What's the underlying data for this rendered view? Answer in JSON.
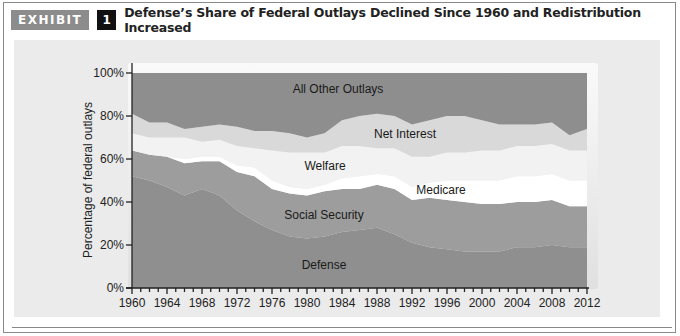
{
  "header": {
    "exhibit_label": "EXHIBIT",
    "exhibit_number": "1",
    "title": "Defense’s Share of Federal Outlays Declined Since 1960 and Redistribution Increased"
  },
  "colors": {
    "exhibit_badge": "#8c8c8c",
    "number_badge": "#111111",
    "panel_bg": "#ebebeb",
    "defense": "#8f8f8f",
    "social_security": "#9d9d9d",
    "medicare": "#ffffff",
    "welfare": "#f2f2f2",
    "net_interest": "#d9d9d9",
    "all_other": "#8e8e8e"
  },
  "chart_data": {
    "type": "area",
    "stacked": true,
    "title": "Defense’s Share of Federal Outlays Declined Since 1960 and Redistribution Increased",
    "xlabel": "",
    "ylabel": "Percentage of federal outlays",
    "ylim": [
      0,
      100
    ],
    "xlim": [
      1960,
      2012
    ],
    "y_ticks": [
      "0%",
      "20%",
      "40%",
      "60%",
      "80%",
      "100%"
    ],
    "x_ticks": [
      "1960",
      "1964",
      "1968",
      "1972",
      "1976",
      "1980",
      "1984",
      "1988",
      "1992",
      "1996",
      "2000",
      "2004",
      "2008",
      "2012"
    ],
    "grid": false,
    "legend": "inline labels",
    "x": [
      1960,
      1962,
      1964,
      1966,
      1968,
      1970,
      1972,
      1974,
      1976,
      1978,
      1980,
      1982,
      1984,
      1986,
      1988,
      1990,
      1992,
      1994,
      1996,
      1998,
      2000,
      2002,
      2004,
      2006,
      2008,
      2010,
      2012
    ],
    "series": [
      {
        "name": "Defense",
        "values": [
          52,
          50,
          47,
          43,
          46,
          43,
          36,
          31,
          27,
          24,
          23,
          24,
          26,
          27,
          28,
          25,
          21,
          19,
          18,
          17,
          17,
          17,
          19,
          19,
          20,
          19,
          19
        ]
      },
      {
        "name": "Social Security",
        "values": [
          12,
          12,
          14,
          15,
          13,
          16,
          18,
          21,
          19,
          20,
          20,
          21,
          20,
          19,
          20,
          21,
          20,
          23,
          23,
          23,
          22,
          22,
          21,
          21,
          21,
          19,
          19
        ]
      },
      {
        "name": "Medicare",
        "values": [
          0,
          0,
          0,
          2,
          2,
          2,
          3,
          4,
          4,
          3,
          3,
          3,
          5,
          6,
          5,
          6,
          6,
          7,
          9,
          10,
          11,
          11,
          12,
          12,
          12,
          12,
          12
        ]
      },
      {
        "name": "Welfare",
        "values": [
          8,
          8,
          9,
          10,
          7,
          8,
          9,
          9,
          14,
          16,
          17,
          15,
          15,
          14,
          12,
          13,
          14,
          12,
          13,
          13,
          14,
          14,
          14,
          14,
          14,
          14,
          14
        ]
      },
      {
        "name": "Net Interest",
        "values": [
          9,
          7,
          7,
          4,
          7,
          7,
          9,
          8,
          9,
          9,
          7,
          9,
          12,
          14,
          16,
          15,
          15,
          17,
          17,
          17,
          14,
          12,
          10,
          10,
          10,
          7,
          10
        ]
      },
      {
        "name": "All Other Outlays",
        "values": [
          19,
          23,
          23,
          26,
          25,
          24,
          25,
          27,
          27,
          28,
          30,
          28,
          22,
          20,
          19,
          20,
          24,
          22,
          20,
          20,
          22,
          24,
          24,
          24,
          23,
          29,
          26
        ]
      }
    ],
    "annotations": [
      "All Other Outlays",
      "Net Interest",
      "Welfare",
      "Medicare",
      "Social Security",
      "Defense"
    ]
  },
  "labels": {
    "all_other": "All Other Outlays",
    "net_interest": "Net Interest",
    "welfare": "Welfare",
    "medicare": "Medicare",
    "social_security": "Social Security",
    "defense": "Defense",
    "y_axis": "Percentage of federal outlays"
  }
}
